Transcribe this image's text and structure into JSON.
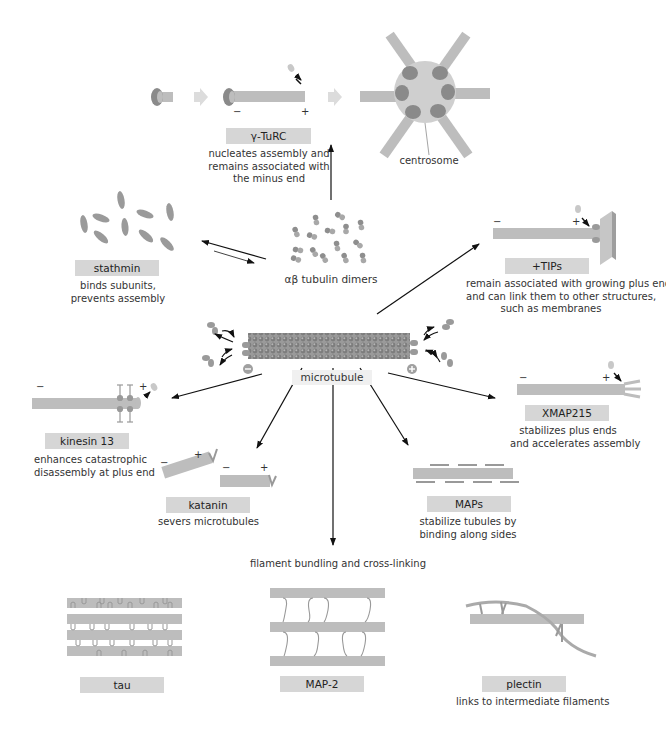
{
  "center": {
    "label": "microtubule",
    "minus_symbol": "−",
    "plus_symbol": "+"
  },
  "dimers": {
    "label": "αβ tubulin dimers"
  },
  "gamma_turc": {
    "label": "γ-TuRC",
    "caption": [
      "nucleates assembly and",
      "remains associated with",
      "the minus end"
    ],
    "minus": "−",
    "plus": "+"
  },
  "centrosome": {
    "caption": "centrosome"
  },
  "stathmin": {
    "label": "stathmin",
    "caption": [
      "binds subunits,",
      "prevents assembly"
    ]
  },
  "tips": {
    "label": "+TIPs",
    "caption": [
      "remain associated with growing plus ends",
      "and can link them to other structures,",
      "such as membranes"
    ],
    "minus": "−",
    "plus": "+"
  },
  "kinesin13": {
    "label": "kinesin 13",
    "caption": [
      "enhances catastrophic",
      "disassembly at plus end"
    ],
    "minus": "−",
    "plus": "+"
  },
  "katanin": {
    "label": "katanin",
    "caption": [
      "severs microtubules"
    ],
    "minus": "−",
    "plus": "+"
  },
  "maps": {
    "label": "MAPs",
    "caption": [
      "stabilize tubules by",
      "binding along sides"
    ]
  },
  "xmap215": {
    "label": "XMAP215",
    "caption": [
      "stabilizes plus ends",
      "and accelerates assembly"
    ],
    "minus": "−",
    "plus": "+"
  },
  "bundling": {
    "caption": "filament bundling and cross-linking"
  },
  "tau": {
    "label": "tau"
  },
  "map2": {
    "label": "MAP-2"
  },
  "plectin": {
    "label": "plectin",
    "caption": [
      "links to intermediate filaments"
    ]
  },
  "colors": {
    "tube": "#bdbdbd",
    "cap": "#8a8a8a",
    "label_bg": "#d6d6d6",
    "arrow": "#111111",
    "centrosome": "#cfcfcf"
  }
}
